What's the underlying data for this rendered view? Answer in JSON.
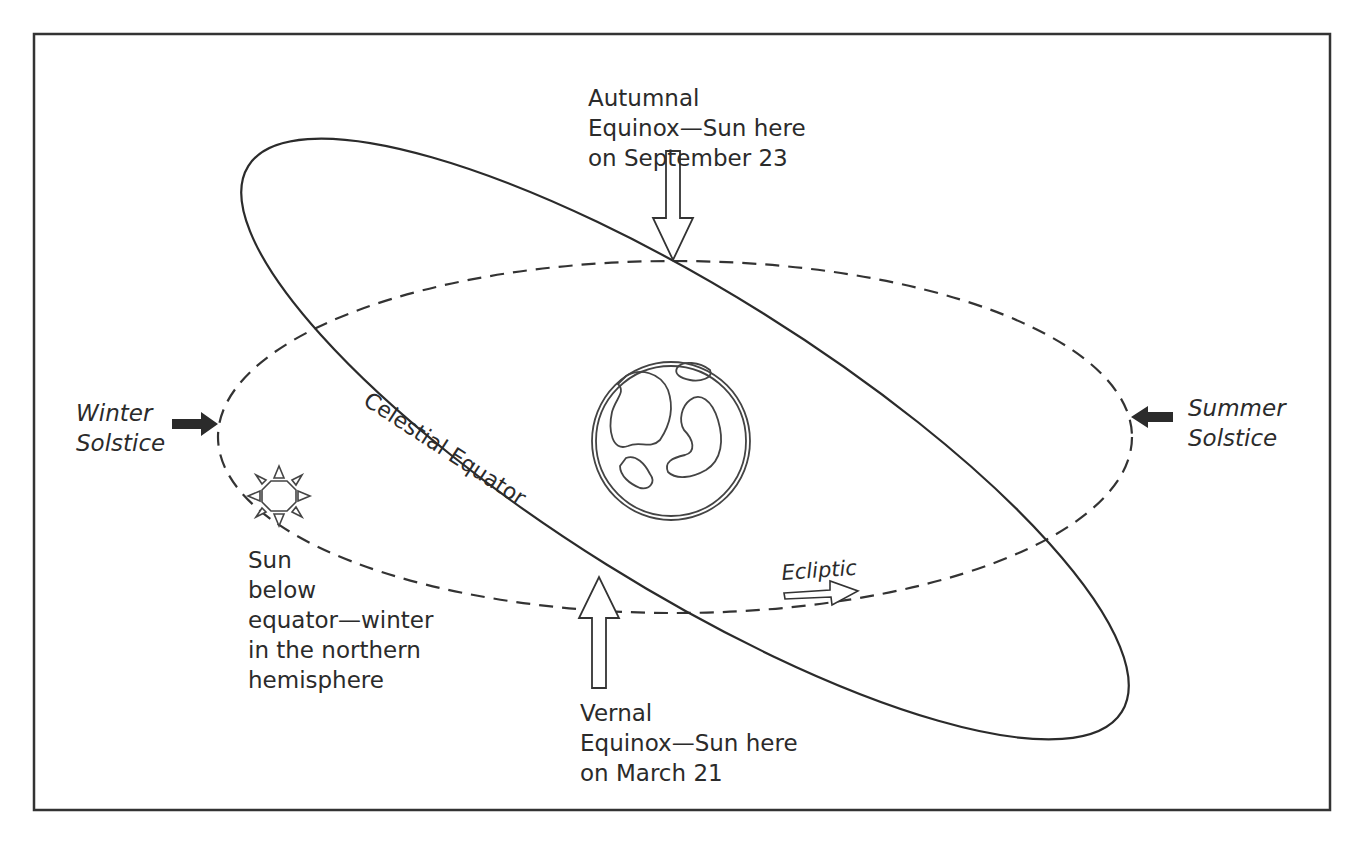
{
  "diagram": {
    "frame": {
      "x": 34,
      "y": 34,
      "width": 1296,
      "height": 776,
      "stroke": "#333333"
    },
    "labels": {
      "autumnal_equinox": [
        "Autumnal",
        "Equinox—Sun here",
        "on September 23"
      ],
      "vernal_equinox": [
        "Vernal",
        "Equinox—Sun here",
        "on March 21"
      ],
      "winter_solstice": [
        "Winter",
        "Solstice"
      ],
      "summer_solstice": [
        "Summer",
        "Solstice"
      ],
      "celestial_equator": "Celestial Equator",
      "ecliptic": "Ecliptic",
      "sun_note": [
        "Sun",
        "below",
        "equator—winter",
        "in the northern",
        "hemisphere"
      ]
    },
    "elements": {
      "celestial_equator": {
        "type": "ellipse",
        "style": "solid",
        "cx": 685,
        "cy": 439,
        "rx": 515,
        "ry": 148,
        "rotate_deg": 32
      },
      "ecliptic": {
        "type": "ellipse",
        "style": "dashed",
        "cx": 675,
        "cy": 437,
        "rx": 457,
        "ry": 176
      },
      "earth": {
        "type": "globe",
        "cx": 671,
        "cy": 441,
        "r": 77
      },
      "sun": {
        "type": "sun-icon",
        "cx": 279,
        "cy": 494
      },
      "arrows": [
        {
          "name": "autumnal-equinox-arrow",
          "direction": "down",
          "style": "hollow"
        },
        {
          "name": "vernal-equinox-arrow",
          "direction": "up",
          "style": "hollow"
        },
        {
          "name": "winter-solstice-arrow",
          "direction": "right",
          "style": "filled"
        },
        {
          "name": "summer-solstice-arrow",
          "direction": "left",
          "style": "filled"
        },
        {
          "name": "ecliptic-direction-arrow",
          "direction": "right",
          "style": "hollow"
        }
      ]
    },
    "colors": {
      "ink": "#2b2b2b",
      "background": "#ffffff"
    }
  }
}
